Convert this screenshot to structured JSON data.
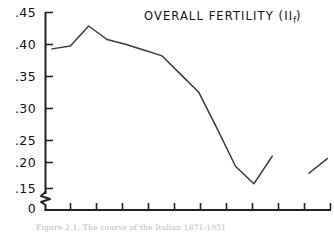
{
  "figure": {
    "title_main": "OVERALL FERTILITY (I",
    "title_sub": "f",
    "title_close": ")",
    "title_plain": "OVERALL FERTILITY (If)",
    "caption": "Figure 2.1.  The course of the Italian 1871-1951",
    "background_color": "#ffffff",
    "line_color": "#3a3a3a",
    "axis_color": "#222222"
  },
  "axes": {
    "y_axis_name": "overall-fertility-axis",
    "x_axis_name": "time-axis",
    "y_tick_labels": [
      ".45",
      ".40",
      ".35",
      ".30",
      ".25",
      ".20",
      ".15",
      "0"
    ],
    "y_tick_values": [
      0.45,
      0.4,
      0.35,
      0.3,
      0.25,
      0.2,
      0.15,
      0.0
    ],
    "y_axis_break": true,
    "y_break_between": [
      0.15,
      0.0
    ],
    "x_tick_count": 11,
    "x_tick_labels": []
  },
  "chart_data": {
    "type": "line",
    "xlabel": "",
    "ylabel": "",
    "ylim": [
      0.15,
      0.45
    ],
    "grid": false,
    "legend": "none",
    "axis_break_y": true,
    "series": [
      {
        "name": "overall-fertility-main",
        "values": [
          0.388,
          0.393,
          0.427,
          0.404,
          0.396,
          0.386,
          0.376,
          0.345,
          0.314,
          0.252,
          0.188,
          0.158,
          0.205
        ],
        "x_index": [
          0,
          1,
          2,
          3,
          4,
          5,
          6,
          7,
          8,
          9,
          10,
          11,
          12
        ]
      },
      {
        "name": "overall-fertility-tail",
        "values": [
          0.176,
          0.201
        ],
        "x_index": [
          14,
          15
        ]
      }
    ]
  }
}
